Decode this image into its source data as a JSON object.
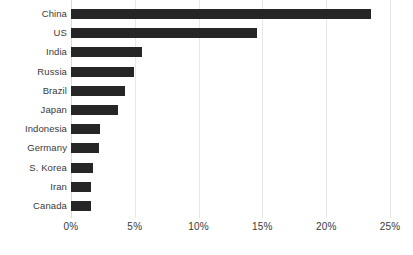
{
  "chart_data": {
    "type": "bar",
    "orientation": "horizontal",
    "title": "",
    "subtitle": "",
    "xlabel": "",
    "ylabel": "",
    "categories": [
      "China",
      "US",
      "India",
      "Russia",
      "Brazil",
      "Japan",
      "Indonesia",
      "Germany",
      "S. Korea",
      "Iran",
      "Canada"
    ],
    "values": [
      23.5,
      14.6,
      5.6,
      4.9,
      4.2,
      3.7,
      2.3,
      2.2,
      1.7,
      1.6,
      1.6
    ],
    "value_unit": "%",
    "xlim": [
      0,
      25
    ],
    "xticks": [
      0,
      5,
      10,
      15,
      20,
      25
    ],
    "xtick_labels": [
      "0%",
      "5%",
      "10%",
      "15%",
      "20%",
      "25%"
    ],
    "grid": true,
    "grid_axis": "x",
    "legend": false,
    "legend_position": "none",
    "series": [
      {
        "name": "Share",
        "values": [
          23.5,
          14.6,
          5.6,
          4.9,
          4.2,
          3.7,
          2.3,
          2.2,
          1.7,
          1.6,
          1.6
        ]
      }
    ]
  },
  "style": {
    "bar_color": "#262626",
    "grid_color": "#e8e8e8",
    "axis_color": "#d9d9d9",
    "text_color": "#3a3a3a",
    "background": "#ffffff"
  }
}
